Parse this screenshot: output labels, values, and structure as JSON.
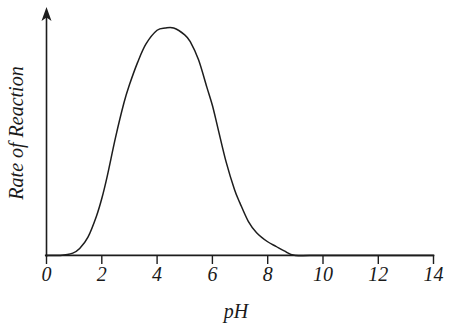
{
  "chart_data": {
    "type": "line",
    "title": "",
    "xlabel": "pH",
    "ylabel": "Rate of Reaction",
    "xlim": [
      0,
      14
    ],
    "ylim": [
      0,
      1
    ],
    "grid": false,
    "legend": null,
    "x_ticks": [
      0,
      2,
      4,
      6,
      8,
      10,
      12,
      14
    ],
    "x_tick_labels": [
      "0",
      "2",
      "4",
      "6",
      "8",
      "10",
      "12",
      "14"
    ],
    "y_ticks": [],
    "y_tick_labels": [],
    "y_axis_arrow": true,
    "series": [
      {
        "name": "Rate of Reaction vs pH",
        "color": "#1d1d1d",
        "x": [
          0.0,
          0.5,
          0.95,
          1.2,
          1.5,
          1.8,
          2.0,
          2.2,
          2.5,
          2.8,
          3.0,
          3.3,
          3.6,
          4.0,
          4.3,
          4.6,
          5.0,
          5.2,
          5.5,
          5.8,
          6.0,
          6.2,
          6.5,
          6.8,
          7.0,
          7.3,
          7.6,
          8.0,
          8.3,
          8.6,
          9.0,
          10.0,
          12.0,
          14.0
        ],
        "y": [
          0.0,
          0.0,
          0.01,
          0.03,
          0.08,
          0.17,
          0.25,
          0.35,
          0.52,
          0.67,
          0.75,
          0.85,
          0.93,
          0.99,
          1.0,
          1.0,
          0.97,
          0.94,
          0.86,
          0.74,
          0.66,
          0.56,
          0.41,
          0.29,
          0.23,
          0.15,
          0.1,
          0.06,
          0.04,
          0.02,
          0.0,
          0.0,
          0.0,
          0.0
        ]
      }
    ],
    "annotations": []
  },
  "axes": {
    "x_axis_name": "ph-axis",
    "y_axis_name": "rate-axis"
  }
}
